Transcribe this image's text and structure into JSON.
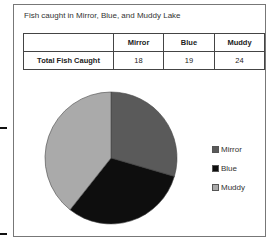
{
  "chart_data": {
    "type": "pie",
    "title": "Fish caught in Mirror, Blue, and Muddy Lake",
    "categories": [
      "Mirror",
      "Blue",
      "Muddy"
    ],
    "values": [
      18,
      19,
      24
    ],
    "colors": [
      "#5a5a5a",
      "#0e0e0e",
      "#aaaaaa"
    ],
    "legend_position": "right",
    "table": {
      "headers": [
        "",
        "Mirror",
        "Blue",
        "Muddy"
      ],
      "rows": [
        [
          "Total Fish Caught",
          "18",
          "19",
          "24"
        ]
      ]
    }
  }
}
